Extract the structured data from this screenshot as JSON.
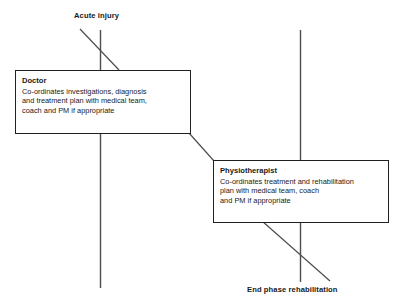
{
  "diagram": {
    "title_top": "Acute injury",
    "title_bottom": "End phase rehabilitation",
    "timeline_color": "#4d4d4d",
    "box_border_color": "#231f20",
    "text_color": "#1a1a1a",
    "background_color": "#ffffff",
    "boxes": [
      {
        "id": "doctor",
        "title": "Doctor",
        "desc_lines": [
          "Co-ordinates investigations, diagnosis",
          "and treatment plan with medical team,",
          "coach and PM if appropriate"
        ]
      },
      {
        "id": "physiotherapist",
        "title": "Physiotherapist",
        "desc_lines": [
          "Co-ordinates treatment and rehabilitation",
          "plan with medical team, coach",
          "and PM if appropriate"
        ]
      }
    ]
  }
}
